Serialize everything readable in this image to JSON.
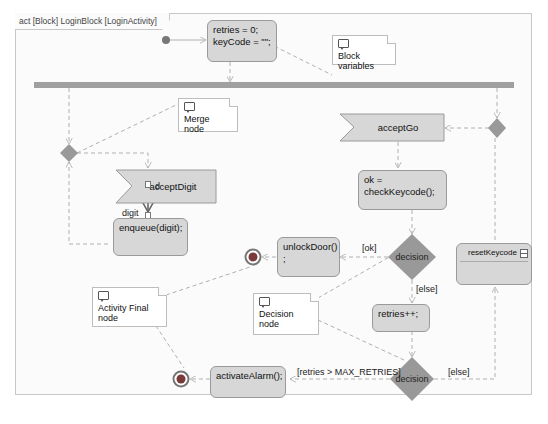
{
  "frame": {
    "title": "act [Block] LoginBlock [LoginActivity]"
  },
  "actions": {
    "init": {
      "line1": "retries = 0;",
      "line2": "keyCode = \"\";"
    },
    "enqueue": {
      "text": "enqueue(digit);"
    },
    "check": {
      "text": "ok = checkKeycode();"
    },
    "unlock": {
      "line1": "unlockDoor()",
      "line2": ";"
    },
    "retries": {
      "text": "retries++;"
    },
    "alarm": {
      "text": "activateAlarm();"
    },
    "reset": {
      "text": "resetKeycode"
    }
  },
  "accept_events": {
    "digit": {
      "text": "acceptDigit"
    },
    "go": {
      "text": "acceptGo"
    }
  },
  "pins": {
    "out_label": "d",
    "in_label": "digit"
  },
  "decisions": {
    "d1": {
      "text": "decision"
    },
    "d2": {
      "text": "decision"
    }
  },
  "guards": {
    "ok": "[ok]",
    "else1": "[else]",
    "max": "[retries > MAX_RETRIES]",
    "else2": "[else]"
  },
  "notes": {
    "block_vars": "Block variables",
    "merge": "Merge node",
    "final": "Activity Final node",
    "decision": "Decision node"
  },
  "colors": {
    "action_fill": "#d7d7d7",
    "diamond_fill": "#999999",
    "fork_bar": "#a0a0a0",
    "edge": "#b0b0b0",
    "control_edge": "#666666",
    "final_ring": "#777777",
    "final_core": "#7a3a3a"
  }
}
